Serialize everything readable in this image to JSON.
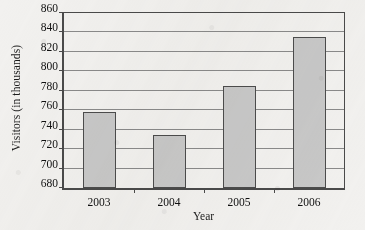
{
  "chart_data": {
    "type": "bar",
    "title": "",
    "xlabel": "Year",
    "ylabel": "Visitors (in thousands)",
    "categories": [
      "2003",
      "2004",
      "2005",
      "2006"
    ],
    "values": [
      758,
      735,
      785,
      835
    ],
    "ylim": [
      680,
      860
    ],
    "ytick_step": 20,
    "yticks": [
      680,
      700,
      720,
      740,
      760,
      780,
      800,
      820,
      840,
      860
    ],
    "ytick_labels": [
      "680",
      "700",
      "720",
      "740",
      "760",
      "780",
      "800",
      "820",
      "840",
      "860"
    ],
    "grid": "horizontal",
    "legend": "none",
    "series": [
      {
        "name": "Visitors",
        "values": [
          758,
          735,
          785,
          835
        ]
      }
    ],
    "colors": {
      "bar_fill": "#c8c8c8",
      "bar_border": "#4c4c4c",
      "gridline": "#8a8a8a",
      "axis": "#4a4a4a",
      "text": "#101010",
      "background": "#f2f1ef"
    }
  }
}
